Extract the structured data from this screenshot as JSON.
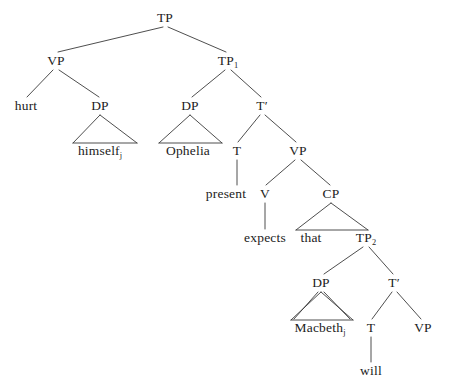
{
  "figure": {
    "kind": "syntax-tree",
    "background_color": "#ffffff",
    "line_color": "#3a3a3a",
    "text_color": "#1c1c1c"
  },
  "nodes": [
    {
      "id": "tp",
      "label": "TP",
      "sub": "",
      "x": 165,
      "y": 18,
      "type": "category"
    },
    {
      "id": "vp_left",
      "label": "VP",
      "sub": "",
      "x": 56,
      "y": 61,
      "type": "category"
    },
    {
      "id": "tp1",
      "label": "TP",
      "sub": "1",
      "x": 228,
      "y": 61,
      "type": "category"
    },
    {
      "id": "hurt",
      "label": "hurt",
      "sub": "",
      "x": 26,
      "y": 106,
      "type": "terminal"
    },
    {
      "id": "dp_himself",
      "label": "DP",
      "sub": "",
      "x": 100,
      "y": 106,
      "type": "category"
    },
    {
      "id": "dp_ophelia",
      "label": "DP",
      "sub": "",
      "x": 190,
      "y": 106,
      "type": "category"
    },
    {
      "id": "tbar1",
      "label": "T",
      "sub": "",
      "x": 262,
      "y": 106,
      "type": "bar"
    },
    {
      "id": "himself",
      "label": "himself",
      "sub": "j",
      "x": 100,
      "y": 151,
      "type": "terminal"
    },
    {
      "id": "ophelia",
      "label": "Ophelia",
      "sub": "",
      "x": 188,
      "y": 151,
      "type": "terminal"
    },
    {
      "id": "t1",
      "label": "T",
      "sub": "",
      "x": 237,
      "y": 151,
      "type": "category"
    },
    {
      "id": "vp_mid",
      "label": "VP",
      "sub": "",
      "x": 298,
      "y": 151,
      "type": "category"
    },
    {
      "id": "present",
      "label": "present",
      "sub": "",
      "x": 226,
      "y": 194,
      "type": "terminal"
    },
    {
      "id": "v",
      "label": "V",
      "sub": "",
      "x": 265,
      "y": 194,
      "type": "category"
    },
    {
      "id": "cp",
      "label": "CP",
      "sub": "",
      "x": 331,
      "y": 194,
      "type": "category"
    },
    {
      "id": "expects",
      "label": "expects",
      "sub": "",
      "x": 265,
      "y": 238,
      "type": "terminal"
    },
    {
      "id": "that",
      "label": "that",
      "sub": "",
      "x": 311,
      "y": 238,
      "type": "terminal"
    },
    {
      "id": "tp2",
      "label": "TP",
      "sub": "2",
      "x": 366,
      "y": 238,
      "type": "category"
    },
    {
      "id": "dp_macbeth",
      "label": "DP",
      "sub": "",
      "x": 321,
      "y": 283,
      "type": "category"
    },
    {
      "id": "tbar2",
      "label": "T",
      "sub": "",
      "x": 394,
      "y": 283,
      "type": "bar"
    },
    {
      "id": "macbeth",
      "label": "Macbeth",
      "sub": "j",
      "x": 320,
      "y": 328,
      "type": "terminal"
    },
    {
      "id": "t2",
      "label": "T",
      "sub": "",
      "x": 371,
      "y": 328,
      "type": "category"
    },
    {
      "id": "vp_bottom",
      "label": "VP",
      "sub": "",
      "x": 423,
      "y": 328,
      "type": "category"
    },
    {
      "id": "will",
      "label": "will",
      "sub": "",
      "x": 371,
      "y": 371,
      "type": "terminal"
    }
  ],
  "edges": [
    {
      "from": "tp",
      "to": "vp_left",
      "x1": 163,
      "y1": 27,
      "x2": 58,
      "y2": 52
    },
    {
      "from": "tp",
      "to": "tp1",
      "x1": 168,
      "y1": 27,
      "x2": 226,
      "y2": 52
    },
    {
      "from": "vp_left",
      "to": "hurt",
      "x1": 53,
      "y1": 70,
      "x2": 27,
      "y2": 97
    },
    {
      "from": "vp_left",
      "to": "dp_himself",
      "x1": 59,
      "y1": 70,
      "x2": 99,
      "y2": 97
    },
    {
      "from": "tp1",
      "to": "dp_ophelia",
      "x1": 225,
      "y1": 70,
      "x2": 192,
      "y2": 97
    },
    {
      "from": "tp1",
      "to": "tbar1",
      "x1": 231,
      "y1": 70,
      "x2": 261,
      "y2": 97
    },
    {
      "from": "tbar1",
      "to": "t1",
      "x1": 260,
      "y1": 115,
      "x2": 238,
      "y2": 142
    },
    {
      "from": "tbar1",
      "to": "vp_mid",
      "x1": 265,
      "y1": 115,
      "x2": 296,
      "y2": 142
    },
    {
      "from": "t1",
      "to": "present",
      "x1": 237,
      "y1": 160,
      "x2": 237,
      "y2": 185
    },
    {
      "from": "vp_mid",
      "to": "v",
      "x1": 295,
      "y1": 160,
      "x2": 266,
      "y2": 185
    },
    {
      "from": "vp_mid",
      "to": "cp",
      "x1": 301,
      "y1": 160,
      "x2": 330,
      "y2": 185
    },
    {
      "from": "v",
      "to": "expects",
      "x1": 265,
      "y1": 203,
      "x2": 265,
      "y2": 229
    },
    {
      "from": "tp2",
      "to": "dp_macbeth",
      "x1": 363,
      "y1": 247,
      "x2": 324,
      "y2": 274
    },
    {
      "from": "tp2",
      "to": "tbar2",
      "x1": 369,
      "y1": 247,
      "x2": 393,
      "y2": 274
    },
    {
      "from": "dp_macbeth",
      "to": "macbeth",
      "x1": 318,
      "y1": 292,
      "x2": 294,
      "y2": 319
    },
    {
      "from": "dp_macbeth",
      "to": "macbeth2",
      "x1": 324,
      "y1": 292,
      "x2": 350,
      "y2": 319
    },
    {
      "from": "tbar2",
      "to": "t2",
      "x1": 392,
      "y1": 292,
      "x2": 372,
      "y2": 319
    },
    {
      "from": "tbar2",
      "to": "vp_bottom",
      "x1": 397,
      "y1": 292,
      "x2": 421,
      "y2": 319
    },
    {
      "from": "t2",
      "to": "will",
      "x1": 371,
      "y1": 337,
      "x2": 371,
      "y2": 362
    }
  ],
  "triangles": [
    {
      "id": "tri-himself",
      "node": "dp_himself",
      "apex_x": 100,
      "apex_y": 115,
      "left_x": 73,
      "right_x": 137,
      "base_y": 143
    },
    {
      "id": "tri-ophelia",
      "node": "dp_ophelia",
      "apex_x": 190,
      "apex_y": 115,
      "left_x": 159,
      "right_x": 222,
      "base_y": 143
    },
    {
      "id": "tri-cp",
      "node": "cp",
      "apex_x": 331,
      "apex_y": 203,
      "left_x": 296,
      "right_x": 368,
      "base_y": 230
    },
    {
      "id": "tri-macbeth",
      "node": "dp_macbeth",
      "apex_x": 321,
      "apex_y": 292,
      "left_x": 291,
      "right_x": 353,
      "base_y": 320
    }
  ]
}
